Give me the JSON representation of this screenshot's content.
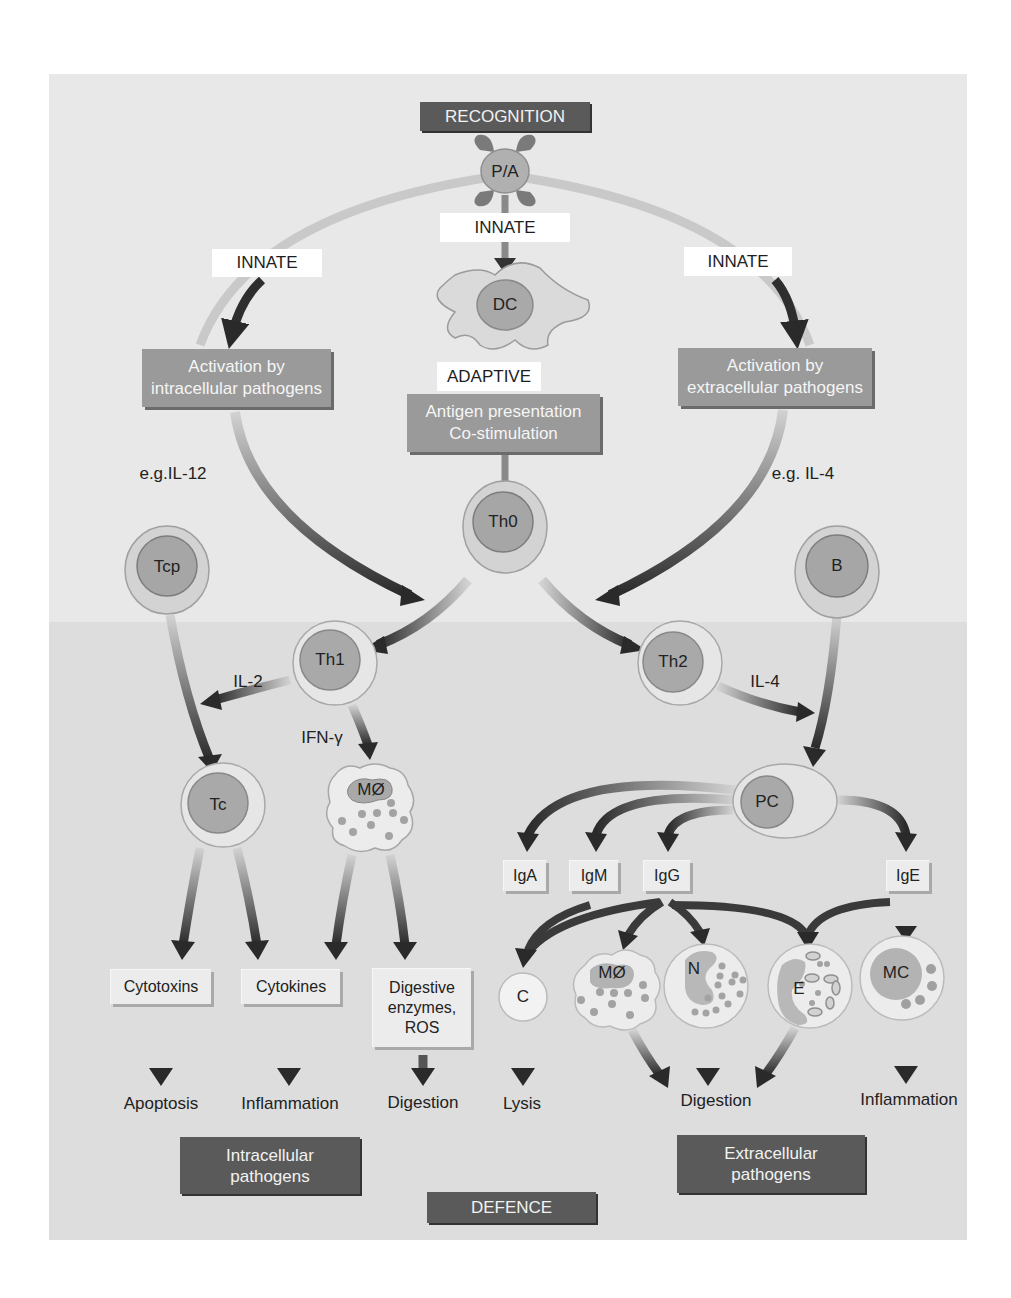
{
  "title_boxes": {
    "recognition": "RECOGNITION",
    "defence": "DEFENCE"
  },
  "pathway_labels": {
    "innate_center": "INNATE",
    "innate_left": "INNATE",
    "innate_right": "INNATE",
    "adaptive": "ADAPTIVE"
  },
  "process_boxes": {
    "activation_intracellular": [
      "Activation by",
      "intracellular pathogens"
    ],
    "activation_extracellular": [
      "Activation by",
      "extracellular pathogens"
    ],
    "antigen_presentation": [
      "Antigen presentation",
      "Co-stimulation"
    ]
  },
  "cytokine_labels": {
    "il12": "e.g.IL-12",
    "il4_top": "e.g. IL-4",
    "il2": "IL-2",
    "ifn": "IFN-γ",
    "il4_th2": "IL-4"
  },
  "cells": {
    "pa": "P/A",
    "dc": "DC",
    "th0": "Th0",
    "tcp": "Tcp",
    "b": "B",
    "th1": "Th1",
    "th2": "Th2",
    "tc": "Tc",
    "macrophage_1": "MØ",
    "pc": "PC",
    "c": "C",
    "macrophage_2": "MØ",
    "n": "N",
    "e": "E",
    "mc": "MC"
  },
  "antibodies": [
    "IgA",
    "IgM",
    "IgG",
    "IgE"
  ],
  "effector_boxes": {
    "cytotoxins": "Cytotoxins",
    "cytokines": "Cytokines",
    "digestive": [
      "Digestive",
      "enzymes,",
      "ROS"
    ]
  },
  "outcomes": {
    "apoptosis": "Apoptosis",
    "inflammation_left": "Inflammation",
    "digestion_left": "Digestion",
    "lysis": "Lysis",
    "digestion_right": "Digestion",
    "inflammation_right": "Inflammation"
  },
  "category_boxes": {
    "intracellular": [
      "Intracellular",
      "pathogens"
    ],
    "extracellular": [
      "Extracellular",
      "pathogens"
    ]
  },
  "colors": {
    "frame_top": "#e8e8e8",
    "frame_bottom": "#dddddd",
    "dark_box": "#5a5a5a",
    "mid_box": "#9a9a9a",
    "cell_nucleus": "#a8a8a8",
    "cell_outer": "#d6d6d6",
    "arrow_dark": "#2e2e2e",
    "arrow_light": "#cfcfcf"
  }
}
